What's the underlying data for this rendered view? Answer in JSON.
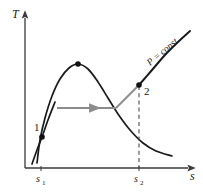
{
  "figure": {
    "background_color": "#ffffff",
    "curve_color": "#1a1a1a",
    "process_color": "#8c8c8c",
    "axis_color": "#3a3a3a"
  },
  "axes": {
    "y_label": "T",
    "x_label": "s",
    "x_origin_px": 25,
    "y_origin_px": 168,
    "x_end_px": 193,
    "y_end_px": 14
  },
  "ticks": {
    "x": [
      {
        "name": "s1",
        "base": "s",
        "sub": "1",
        "x_px": 41
      },
      {
        "name": "s2",
        "base": "s",
        "sub": "2",
        "x_px": 139
      }
    ]
  },
  "states": [
    {
      "label": "1",
      "x_px": 42,
      "y_px": 137,
      "label_x_px": 36,
      "label_y_px": 128
    },
    {
      "label": "2",
      "x_px": 139,
      "y_px": 85,
      "label_x_px": 145,
      "label_y_px": 93
    }
  ],
  "critical_point": {
    "x_px": 78,
    "y_px": 64
  },
  "annotations": {
    "isobar": "P = const."
  },
  "chart_data": {
    "type": "line",
    "xlabel": "s",
    "ylabel": "T",
    "grid": false,
    "legend": "none",
    "series": [
      {
        "name": "saturation-dome",
        "description": "Vapor dome (saturated liquid and saturated vapor lines) peaking at the critical point",
        "points_px": [
          [
            37,
            163
          ],
          [
            40,
            140
          ],
          [
            45,
            118
          ],
          [
            52,
            96
          ],
          [
            60,
            79
          ],
          [
            69,
            68
          ],
          [
            78,
            64
          ],
          [
            88,
            69
          ],
          [
            98,
            82
          ],
          [
            108,
            98
          ],
          [
            118,
            114
          ],
          [
            130,
            130
          ],
          [
            143,
            143
          ],
          [
            156,
            151
          ],
          [
            172,
            156
          ]
        ]
      },
      {
        "name": "isobar-through-state-1",
        "description": "Constant pressure line passing through state 1 in the compressed liquid region",
        "points_px": [
          [
            32,
            164
          ],
          [
            37,
            150
          ],
          [
            42,
            137
          ],
          [
            48,
            120
          ],
          [
            55,
            102
          ]
        ]
      },
      {
        "name": "isobar-P-const",
        "description": "Constant pressure line in the superheated vapor region through state 2",
        "points_px": [
          [
            139,
            85
          ],
          [
            152,
            70
          ],
          [
            165,
            55
          ],
          [
            178,
            42
          ],
          [
            190,
            31
          ]
        ]
      },
      {
        "name": "process-1-to-2",
        "description": "Gray process path: horizontal segment then rise to state 2",
        "points_px": [
          [
            57,
            108
          ],
          [
            118,
            108
          ],
          [
            139,
            85
          ]
        ]
      },
      {
        "name": "constant-entropy-line-s2",
        "description": "Dashed vertical line dropping from state 2 to the s axis at s2",
        "points_px": [
          [
            139,
            85
          ],
          [
            139,
            168
          ]
        ]
      }
    ],
    "annotations": [
      {
        "text": "P = const.",
        "x_px": 160,
        "y_px": 55,
        "rotation_deg": -40
      },
      {
        "text": "1",
        "x_px": 36,
        "y_px": 128
      },
      {
        "text": "2",
        "x_px": 145,
        "y_px": 93
      }
    ]
  }
}
